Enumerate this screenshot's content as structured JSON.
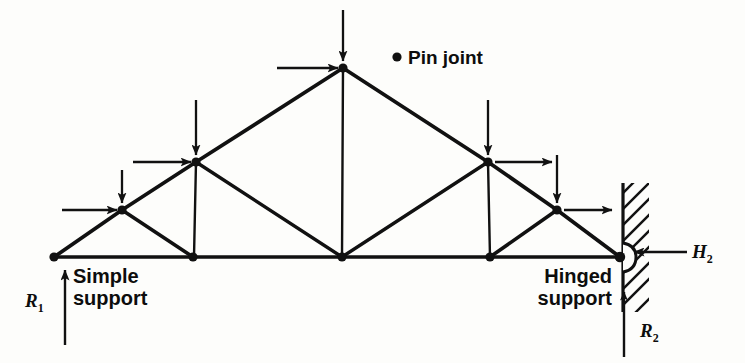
{
  "figure": {
    "type": "structural-truss-diagram",
    "stroke_color": "#111111",
    "background_color": "#fdfdfb"
  },
  "labels": {
    "pin_joint": "Pin joint",
    "simple_support": "Simple\nsupport",
    "hinged_support": "Hinged\nsupport",
    "reaction_left": "R",
    "reaction_left_sub": "1",
    "reaction_right": "R",
    "reaction_right_sub": "2",
    "horizontal_reaction": "H",
    "horizontal_reaction_sub": "2"
  },
  "geometry": {
    "bottom_chord_y": 257,
    "nodes": [
      {
        "id": "L0",
        "name": "left-simple-support-node",
        "x": 54,
        "y": 257
      },
      {
        "id": "L1",
        "name": "bottom-node-1",
        "x": 193,
        "y": 257
      },
      {
        "id": "L2",
        "name": "bottom-center-node",
        "x": 342,
        "y": 257
      },
      {
        "id": "L3",
        "name": "bottom-node-3",
        "x": 490,
        "y": 257
      },
      {
        "id": "L4",
        "name": "right-hinged-support-node",
        "x": 620,
        "y": 257
      },
      {
        "id": "U1",
        "name": "left-lower-rafter-node",
        "x": 122,
        "y": 210
      },
      {
        "id": "U2",
        "name": "left-upper-rafter-node",
        "x": 196,
        "y": 162
      },
      {
        "id": "AP",
        "name": "apex-node",
        "x": 343,
        "y": 68
      },
      {
        "id": "U3",
        "name": "right-upper-rafter-node",
        "x": 488,
        "y": 162
      },
      {
        "id": "U4",
        "name": "right-lower-rafter-node",
        "x": 557,
        "y": 210
      }
    ],
    "members": [
      {
        "name": "bottom-chord-seg-1",
        "from": "L0",
        "to": "L1"
      },
      {
        "name": "bottom-chord-seg-2",
        "from": "L1",
        "to": "L2"
      },
      {
        "name": "bottom-chord-seg-3",
        "from": "L2",
        "to": "L3"
      },
      {
        "name": "bottom-chord-seg-4",
        "from": "L3",
        "to": "L4"
      },
      {
        "name": "left-rafter-seg-1",
        "from": "L0",
        "to": "U1"
      },
      {
        "name": "left-rafter-seg-2",
        "from": "U1",
        "to": "U2"
      },
      {
        "name": "left-rafter-seg-3",
        "from": "U2",
        "to": "AP"
      },
      {
        "name": "right-rafter-seg-1",
        "from": "AP",
        "to": "U3"
      },
      {
        "name": "right-rafter-seg-2",
        "from": "U3",
        "to": "U4"
      },
      {
        "name": "right-rafter-seg-3",
        "from": "U4",
        "to": "L4"
      },
      {
        "name": "web-diagonal-left-1",
        "from": "U1",
        "to": "L1"
      },
      {
        "name": "web-vertical-left",
        "from": "U2",
        "to": "L1"
      },
      {
        "name": "web-diagonal-left-2",
        "from": "U2",
        "to": "L2"
      },
      {
        "name": "web-vertical-center",
        "from": "AP",
        "to": "L2"
      },
      {
        "name": "web-diagonal-right-2",
        "from": "L2",
        "to": "U3"
      },
      {
        "name": "web-vertical-right",
        "from": "U3",
        "to": "L3"
      },
      {
        "name": "web-diagonal-right-1",
        "from": "L3",
        "to": "U4"
      }
    ]
  },
  "loads": {
    "vertical": [
      {
        "name": "vertical-load-at-U1",
        "x": 122,
        "y_from": 170,
        "y_to": 205
      },
      {
        "name": "vertical-load-at-U2",
        "x": 196,
        "y_from": 100,
        "y_to": 157
      },
      {
        "name": "vertical-load-at-apex",
        "x": 343,
        "y_from": 10,
        "y_to": 63
      },
      {
        "name": "vertical-load-at-U3",
        "x": 488,
        "y_from": 100,
        "y_to": 157
      },
      {
        "name": "vertical-load-at-U4",
        "x": 557,
        "y_from": 155,
        "y_to": 205
      }
    ],
    "horizontal": [
      {
        "name": "horizontal-load-at-U1",
        "y": 210,
        "x_from": 62,
        "x_to": 117,
        "dir": "right"
      },
      {
        "name": "horizontal-load-at-U2",
        "y": 162,
        "x_from": 133,
        "x_to": 191,
        "dir": "right"
      },
      {
        "name": "horizontal-load-at-apex",
        "y": 68,
        "x_from": 277,
        "x_to": 338,
        "dir": "right"
      },
      {
        "name": "horizontal-load-at-U3",
        "y": 162,
        "x_from": 495,
        "x_to": 552,
        "dir": "right"
      },
      {
        "name": "horizontal-load-at-U4",
        "y": 210,
        "x_from": 564,
        "x_to": 612,
        "dir": "right"
      }
    ]
  },
  "reactions": [
    {
      "name": "reaction-R1-arrow",
      "x": 65,
      "y_from": 345,
      "y_to": 268,
      "dir": "up"
    },
    {
      "name": "reaction-R2-arrow",
      "x": 624,
      "y_from": 355,
      "y_to": 290,
      "dir": "up"
    },
    {
      "name": "reaction-H2-arrow",
      "y": 252,
      "x_from": 687,
      "x_to": 632,
      "dir": "left"
    }
  ],
  "wall": {
    "name": "hatched-fixed-wall",
    "x": 623,
    "y_top": 183,
    "y_bottom": 312,
    "width": 26,
    "hatch_direction": "up-right"
  },
  "pin_joint_marker": {
    "name": "pin-joint-bullet",
    "x": 397,
    "y": 57,
    "r": 4.5
  }
}
